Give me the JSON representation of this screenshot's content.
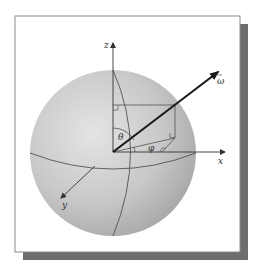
{
  "figure": {
    "labels": {
      "z_axis": "z",
      "x_axis": "x",
      "y_axis": "y",
      "omega": "ω",
      "omega_arrow": "→",
      "theta": "θ",
      "phi": "φ"
    },
    "colors": {
      "sphere_light": "#e2e2e2",
      "sphere_dark": "#a9a9a9",
      "frame_border": "#8a8a8a",
      "shadow": "#6d6d6d",
      "lines": "#333333",
      "vector": "#1a1a1a"
    }
  }
}
